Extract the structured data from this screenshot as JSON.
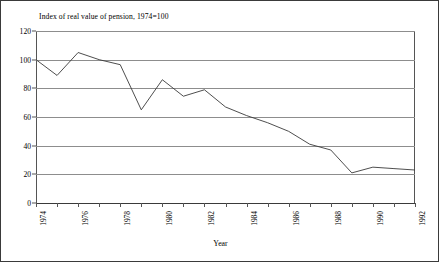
{
  "chart_data": {
    "type": "line",
    "title": "Index of real value of pension, 1974=100",
    "xlabel": "Year",
    "ylabel": "",
    "xlim": [
      1974,
      1992
    ],
    "ylim": [
      0,
      120
    ],
    "grid": true,
    "legend": false,
    "y_ticks": [
      0,
      20,
      40,
      60,
      80,
      100,
      120
    ],
    "y_tick_labels": [
      "0",
      "20",
      "40",
      "60",
      "80",
      "100",
      "120"
    ],
    "x_ticks": [
      1974,
      1975,
      1976,
      1977,
      1978,
      1979,
      1980,
      1981,
      1982,
      1983,
      1984,
      1985,
      1986,
      1987,
      1988,
      1989,
      1990,
      1991,
      1992
    ],
    "x_tick_labels": [
      "1974",
      "",
      "1976",
      "",
      "1978",
      "",
      "1980",
      "",
      "1982",
      "",
      "1984",
      "",
      "1986",
      "",
      "1988",
      "",
      "1990",
      "",
      "1992"
    ],
    "series": [
      {
        "name": "Index of real value of pension",
        "color": "#3a3a3a",
        "x": [
          1974,
          1975,
          1976,
          1977,
          1978,
          1979,
          1980,
          1981,
          1982,
          1983,
          1984,
          1985,
          1986,
          1987,
          1988,
          1989,
          1990,
          1991,
          1992
        ],
        "values": [
          100,
          89,
          105,
          100,
          96.5,
          65,
          86,
          74.5,
          79,
          67,
          61,
          56,
          50,
          41,
          37,
          21,
          25,
          24,
          23
        ]
      }
    ]
  }
}
